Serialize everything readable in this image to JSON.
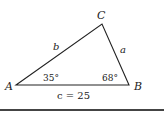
{
  "diagram": {
    "type": "triangle",
    "vertices": {
      "A": {
        "label": "A"
      },
      "B": {
        "label": "B"
      },
      "C": {
        "label": "C"
      }
    },
    "sides": {
      "a": {
        "label": "a"
      },
      "b": {
        "label": "b"
      },
      "c": {
        "label": "c = 25"
      }
    },
    "angles": {
      "A": {
        "label": "35°"
      },
      "B": {
        "label": "68°"
      }
    }
  }
}
